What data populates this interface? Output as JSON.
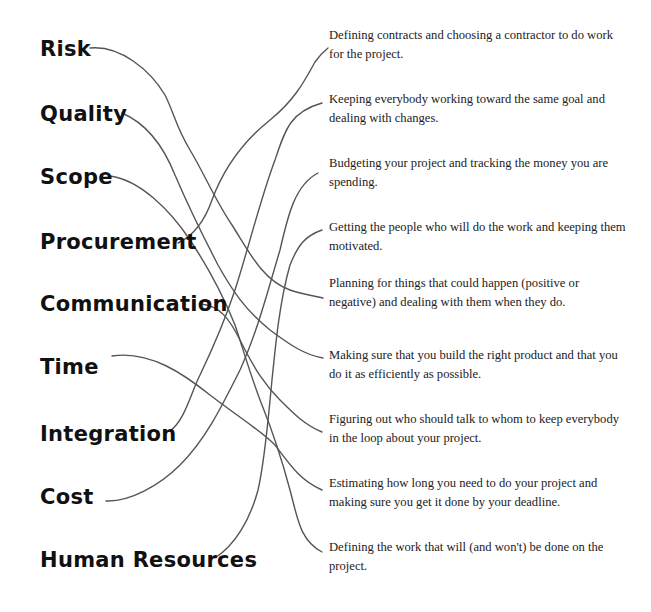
{
  "diagram": {
    "type": "matching-exercise",
    "terms": [
      {
        "id": "risk",
        "label": "Risk"
      },
      {
        "id": "quality",
        "label": "Quality"
      },
      {
        "id": "scope",
        "label": "Scope"
      },
      {
        "id": "procurement",
        "label": "Procurement"
      },
      {
        "id": "communication",
        "label": "Communication"
      },
      {
        "id": "time",
        "label": "Time"
      },
      {
        "id": "integration",
        "label": "Integration"
      },
      {
        "id": "cost",
        "label": "Cost"
      },
      {
        "id": "human_resources",
        "label": "Human Resources"
      }
    ],
    "descriptions": [
      {
        "id": "d1",
        "text": "Defining contracts and choosing a contractor to do work for the project."
      },
      {
        "id": "d2",
        "text": "Keeping everybody working toward the same goal and dealing with changes."
      },
      {
        "id": "d3",
        "text": "Budgeting your project and tracking the money you are spending."
      },
      {
        "id": "d4",
        "text": "Getting the people who will do the work and keeping them motivated."
      },
      {
        "id": "d5",
        "text": "Planning for things that could happen (positive or negative) and dealing with them when they do."
      },
      {
        "id": "d6",
        "text": "Making sure that you build the right product and that you do it as efficiently as possible."
      },
      {
        "id": "d7",
        "text": "Figuring out who should talk to whom to keep everybody in the loop about your project."
      },
      {
        "id": "d8",
        "text": "Estimating how long you need to do your project and making sure you get it done by your deadline."
      },
      {
        "id": "d9",
        "text": "Defining the work that will (and won't) be done on the project."
      }
    ],
    "connections": [
      {
        "from": "Risk",
        "to": "Planning for things that could happen (positive or negative) and dealing with them when they do."
      },
      {
        "from": "Quality",
        "to": "Making sure that you build the right product and that you do it as efficiently as possible."
      },
      {
        "from": "Scope",
        "to": "Defining the work that will (and won't) be done on the project."
      },
      {
        "from": "Procurement",
        "to": "Defining contracts and choosing a contractor to do work for the project."
      },
      {
        "from": "Communication",
        "to": "Figuring out who should talk to whom to keep everybody in the loop about your project."
      },
      {
        "from": "Time",
        "to": "Estimating how long you need to do your project and making sure you get it done by your deadline."
      },
      {
        "from": "Integration",
        "to": "Keeping everybody working toward the same goal and dealing with changes."
      },
      {
        "from": "Cost",
        "to": "Budgeting your project and tracking the money you are spending."
      },
      {
        "from": "Human Resources",
        "to": "Getting the people who will do the work and keeping them motivated."
      }
    ],
    "colors": {
      "background": "#ffffff",
      "term_text": "#111111",
      "description_text": "#222222",
      "line": "#555555"
    }
  }
}
